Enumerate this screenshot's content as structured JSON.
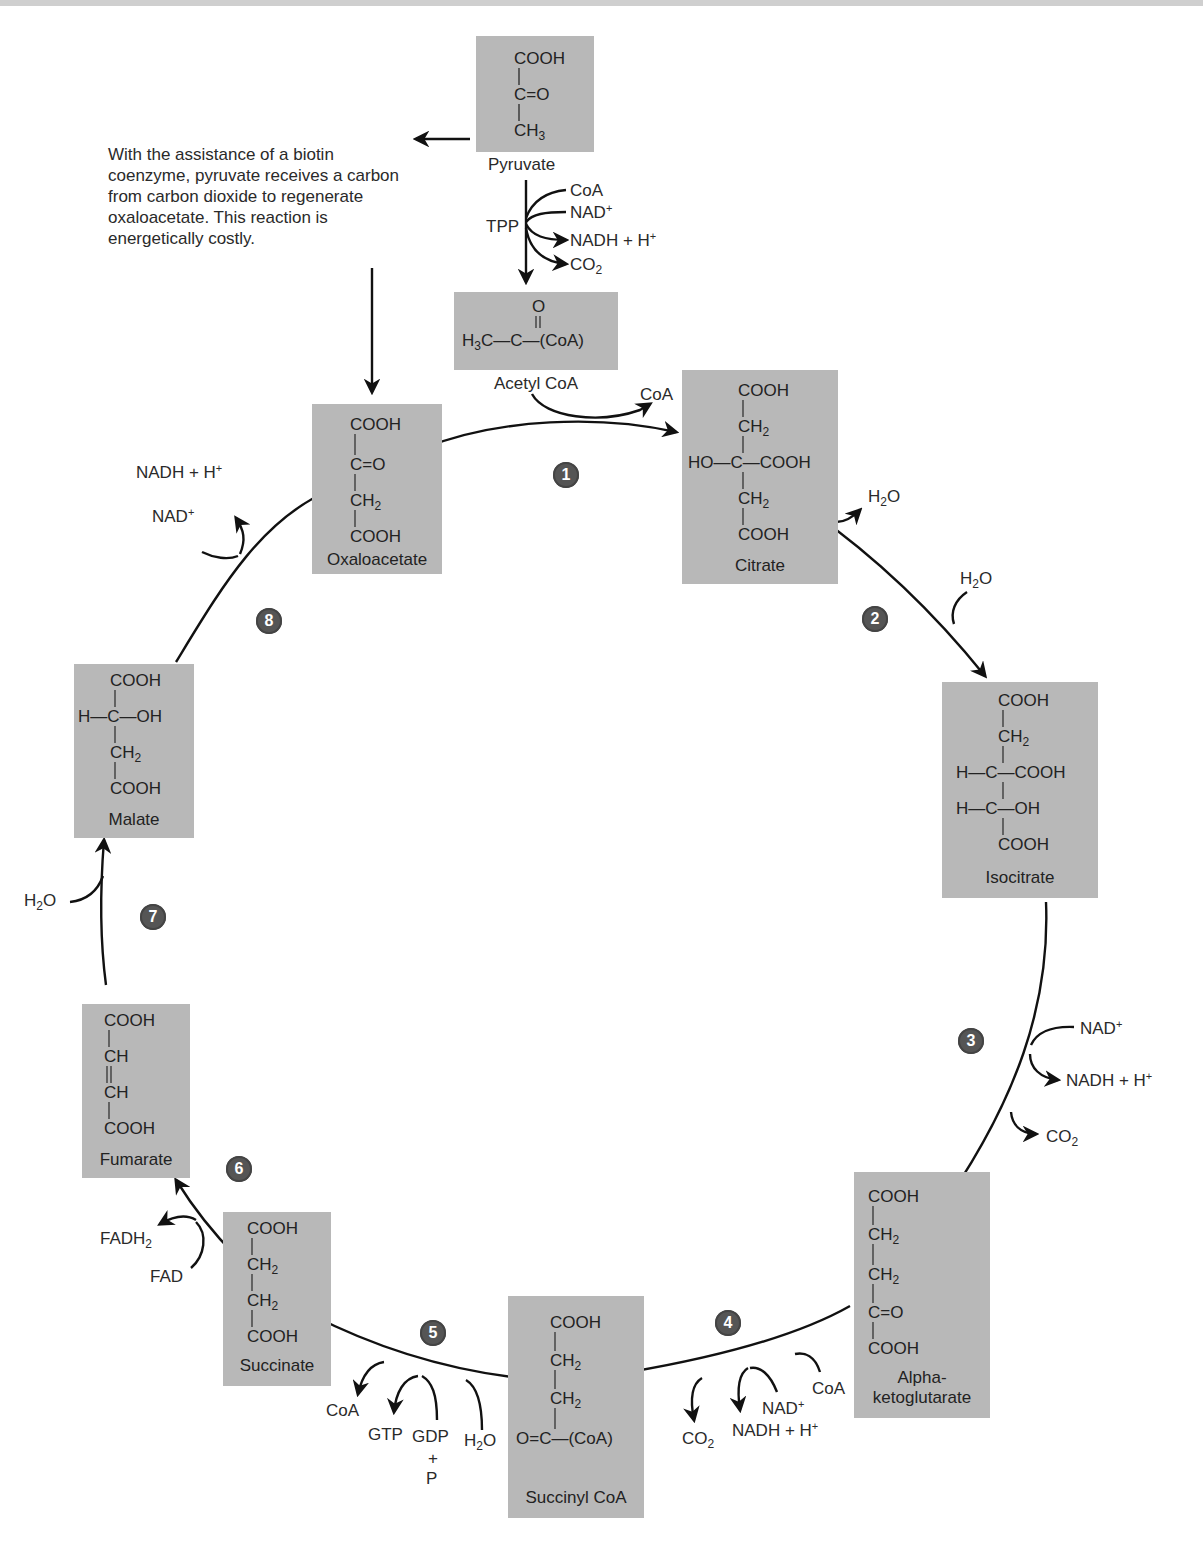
{
  "figure": {
    "colors": {
      "molecule_box": "#b8b8b8",
      "badge": "#555555",
      "arrow": "#111111",
      "text": "#2a2a2a"
    },
    "note": "With the assistance of a biotin coenzyme, pyruvate receives a carbon from carbon dioxide to regenerate oxaloacetate. This reaction is energetically costly."
  },
  "molecules": {
    "pyruvate": {
      "name": "Pyruvate",
      "formula": [
        "COOH",
        "C=O",
        "CH3"
      ]
    },
    "acetyl_coa": {
      "name": "Acetyl CoA",
      "formula": [
        "O",
        "H3C—C—(CoA)"
      ]
    },
    "oxaloacetate": {
      "name": "Oxaloacetate",
      "formula": [
        "COOH",
        "C=O",
        "CH2",
        "COOH"
      ]
    },
    "citrate": {
      "name": "Citrate",
      "formula": [
        "COOH",
        "CH2",
        "HO—C—COOH",
        "CH2",
        "COOH"
      ]
    },
    "isocitrate": {
      "name": "Isocitrate",
      "formula": [
        "COOH",
        "CH2",
        "H—C—COOH",
        "H—C—OH",
        "COOH"
      ]
    },
    "alpha_ketoglutarate": {
      "name_line1": "Alpha-",
      "name_line2": "ketoglutarate",
      "formula": [
        "COOH",
        "CH2",
        "CH2",
        "C=O",
        "COOH"
      ]
    },
    "succinyl_coa": {
      "name": "Succinyl CoA",
      "formula": [
        "COOH",
        "CH2",
        "CH2",
        "O=C—(CoA)"
      ]
    },
    "succinate": {
      "name": "Succinate",
      "formula": [
        "COOH",
        "CH2",
        "CH2",
        "COOH"
      ]
    },
    "fumarate": {
      "name": "Fumarate",
      "formula": [
        "COOH",
        "CH",
        "CH",
        "COOH"
      ]
    },
    "malate": {
      "name": "Malate",
      "formula": [
        "COOH",
        "H—C—OH",
        "CH2",
        "COOH"
      ]
    }
  },
  "cofactors": {
    "pdh": {
      "enzyme_cofactor": "TPP",
      "in1": "CoA",
      "in2": "NAD+",
      "out1": "NADH + H+",
      "out2": "CO2"
    },
    "step1": {
      "out": "CoA"
    },
    "step2": {
      "out": "H2O",
      "in": "H2O"
    },
    "step3": {
      "in": "NAD+",
      "out1": "NADH + H+",
      "out2": "CO2"
    },
    "step4": {
      "in1": "CoA",
      "in2": "NAD+",
      "out1": "NADH + H+",
      "out2": "CO2"
    },
    "step5": {
      "in1": "H2O",
      "in2": "GDP",
      "in2_plus": "+",
      "in2_p": "P",
      "out1": "GTP",
      "out2": "CoA"
    },
    "step6": {
      "in": "FAD",
      "out": "FADH2"
    },
    "step7": {
      "in": "H2O"
    },
    "step8": {
      "in": "NAD+",
      "out": "NADH + H+"
    }
  },
  "steps": [
    "1",
    "2",
    "3",
    "4",
    "5",
    "6",
    "7",
    "8"
  ]
}
